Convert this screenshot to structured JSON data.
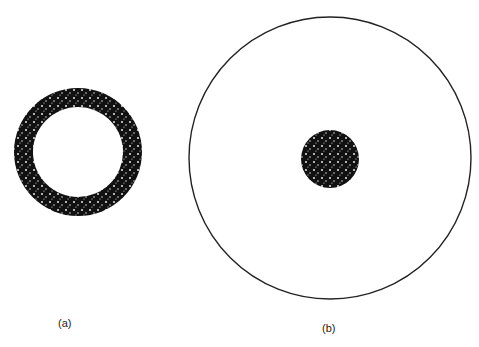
{
  "figure": {
    "panels": [
      {
        "id": "a",
        "label": "(a)",
        "shape": "speckled-ring",
        "center": [
          78,
          152
        ],
        "outer_radius": 64,
        "inner_radius": 45
      },
      {
        "id": "b",
        "label": "(b)",
        "shape": "outline-circle-with-speckled-core",
        "center": [
          330,
          158
        ],
        "outer_radius": 141,
        "core_radius": 29
      }
    ],
    "colors": {
      "ink": "#111111",
      "background": "#ffffff"
    }
  }
}
